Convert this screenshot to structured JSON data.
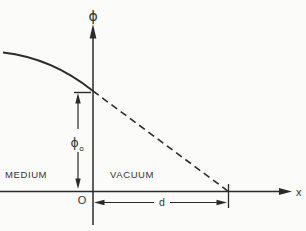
{
  "diagram": {
    "type": "physics-potential-vs-position-diagram",
    "y_axis_label": "ϕ",
    "x_axis_label": "x",
    "origin_label": "O",
    "region_left_label": "MEDIUM",
    "region_right_label": "VACUUM",
    "surface_potential_label": "ϕ",
    "surface_potential_subscript": "o",
    "distance_label": "d",
    "colors": {
      "line": "#2b2b2b",
      "text": "#333333",
      "background": "#fbfbf9"
    }
  }
}
